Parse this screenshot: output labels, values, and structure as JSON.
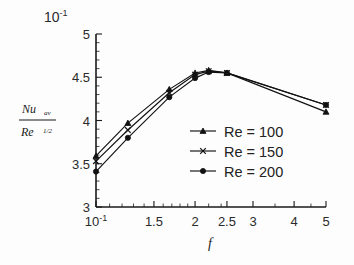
{
  "chart_data": {
    "type": "line",
    "title": "",
    "xlabel": "f",
    "ylabel": "Nu_av / Re^(1/2)",
    "ylabel_numerator": "Nu",
    "ylabel_numerator_sub": "av",
    "ylabel_denominator": "Re",
    "ylabel_denominator_sup": "1/2",
    "y_multiplier": "10",
    "y_multiplier_exp": "-1",
    "xscale": "log",
    "yscale": "linear",
    "xlim": [
      1,
      5
    ],
    "ylim": [
      3,
      5
    ],
    "grid": false,
    "legend_position": "center-right",
    "x_tick_labels": [
      "10-1",
      "1.5",
      "2",
      "2.5",
      "3",
      "4",
      "5"
    ],
    "x_tick_values": [
      1,
      1.5,
      2,
      2.5,
      3,
      4,
      5
    ],
    "x_minor_ticks": [
      1.1,
      1.2,
      1.3,
      1.4,
      1.6,
      1.7,
      1.8,
      1.9,
      2.2,
      2.4,
      3.5,
      4.5
    ],
    "y_tick_labels": [
      "3",
      "3.5",
      "4",
      "4.5",
      "5"
    ],
    "y_tick_values": [
      3,
      3.5,
      4,
      4.5,
      5
    ],
    "y_minor_ticks": [
      3.1,
      3.2,
      3.3,
      3.4,
      3.6,
      3.7,
      3.8,
      3.9,
      4.1,
      4.2,
      4.3,
      4.4,
      4.6,
      4.7,
      4.8,
      4.9
    ],
    "x": [
      1,
      1.25,
      1.67,
      2,
      2.2,
      2.5,
      5
    ],
    "series": [
      {
        "name": "Re = 100",
        "marker": "triangle",
        "values": [
          3.59,
          3.97,
          4.36,
          4.55,
          4.58,
          4.55,
          4.1
        ]
      },
      {
        "name": "Re = 150",
        "marker": "cross",
        "values": [
          3.53,
          3.89,
          4.32,
          4.53,
          4.57,
          4.55,
          4.18
        ]
      },
      {
        "name": "Re = 200",
        "marker": "circle",
        "values": [
          3.41,
          3.8,
          4.27,
          4.49,
          4.56,
          4.55,
          4.18
        ]
      }
    ],
    "legend_entries": [
      "Re = 100",
      "Re = 150",
      "Re = 200"
    ],
    "colors": {
      "axis": "#1a1a1a",
      "series_100": "#111111",
      "series_150": "#111111",
      "series_200": "#111111",
      "background": "#fdfdfd"
    }
  }
}
